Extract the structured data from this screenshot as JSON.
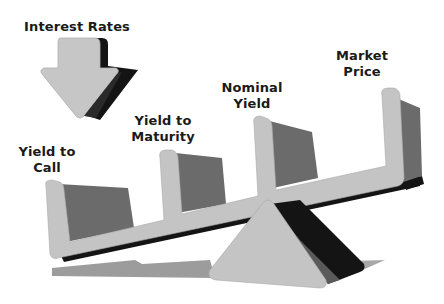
{
  "diagram": {
    "title_label": "Interest Rates",
    "arrow_direction": "down",
    "labels": [
      {
        "line1": "Yield to",
        "line2": "Call"
      },
      {
        "line1": "Yield to",
        "line2": "Maturity"
      },
      {
        "line1": "Nominal",
        "line2": "Yield"
      },
      {
        "line1": "Market",
        "line2": "Price"
      }
    ],
    "colors": {
      "light_face": "#c4c4c4",
      "mid_face": "#6a6a6a",
      "dark_face": "#141414",
      "shadow": "#9a9a9a",
      "text": "#1a1a1a"
    }
  }
}
